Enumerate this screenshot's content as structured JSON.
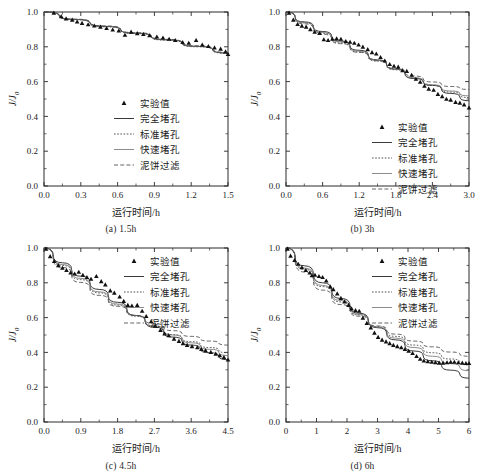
{
  "figure": {
    "axis_labels": {
      "x": "运行时间/h",
      "y": "J/J",
      "y_sub": "0"
    },
    "legend_entries": [
      {
        "key": "experimental",
        "label": "实验值",
        "style": "marker",
        "color": "#111111"
      },
      {
        "key": "complete_blocking",
        "label": "完全堵孔",
        "style": "solid",
        "color": "#3a3a3a"
      },
      {
        "key": "standard_blocking",
        "label": "标准堵孔",
        "style": "dotted",
        "color": "#3a3a3a"
      },
      {
        "key": "rapid_blocking",
        "label": "快速堵孔",
        "style": "thin-solid",
        "color": "#6f6f6f"
      },
      {
        "key": "cake_filtration",
        "label": "泥饼过滤",
        "style": "dashed",
        "color": "#4a4a4a"
      }
    ]
  },
  "chart_data": [
    {
      "type": "scatter",
      "panel": "a",
      "caption": "(a) 1.5h",
      "title": "",
      "xlabel": "运行时间/h",
      "ylabel": "J/J0",
      "xlim": [
        0.0,
        1.5
      ],
      "ylim": [
        0.0,
        1.0
      ],
      "xticks": [
        "0.0",
        "0.3",
        "0.6",
        "0.9",
        "1.2",
        "1.5"
      ],
      "xtick_values": [
        0.0,
        0.3,
        0.6,
        0.9,
        1.2,
        1.5
      ],
      "yticks": [
        "0.0",
        "0.2",
        "0.4",
        "0.6",
        "0.8",
        "1.0"
      ],
      "ytick_values": [
        0.0,
        0.2,
        0.4,
        0.6,
        0.8,
        1.0
      ],
      "grid": false,
      "legend_position": "center",
      "experimental": {
        "name": "实验值",
        "x": [
          0.08,
          0.14,
          0.18,
          0.23,
          0.27,
          0.31,
          0.36,
          0.41,
          0.46,
          0.51,
          0.56,
          0.61,
          0.66,
          0.71,
          0.76,
          0.81,
          0.86,
          0.92,
          0.97,
          1.02,
          1.07,
          1.13,
          1.18,
          1.24,
          1.29,
          1.34,
          1.39,
          1.44,
          1.48,
          1.5
        ],
        "y": [
          0.995,
          0.975,
          0.962,
          0.955,
          0.944,
          0.936,
          0.928,
          0.921,
          0.915,
          0.907,
          0.898,
          0.893,
          0.868,
          0.886,
          0.877,
          0.872,
          0.865,
          0.858,
          0.852,
          0.845,
          0.838,
          0.826,
          0.822,
          0.838,
          0.812,
          0.803,
          0.795,
          0.788,
          0.772,
          0.757
        ]
      },
      "series": [
        {
          "name": "完全堵孔",
          "key": "complete_blocking",
          "x": [
            0.0,
            0.25,
            0.5,
            0.75,
            1.0,
            1.25,
            1.5
          ],
          "y": [
            1.0,
            0.957,
            0.917,
            0.878,
            0.84,
            0.802,
            0.764
          ]
        },
        {
          "name": "标准堵孔",
          "key": "standard_blocking",
          "x": [
            0.0,
            0.25,
            0.5,
            0.75,
            1.0,
            1.25,
            1.5
          ],
          "y": [
            1.0,
            0.956,
            0.915,
            0.876,
            0.838,
            0.8,
            0.762
          ]
        },
        {
          "name": "快速堵孔",
          "key": "rapid_blocking",
          "x": [
            0.0,
            0.25,
            0.5,
            0.75,
            1.0,
            1.25,
            1.5
          ],
          "y": [
            1.0,
            0.958,
            0.918,
            0.879,
            0.841,
            0.803,
            0.765
          ]
        },
        {
          "name": "泥饼过滤",
          "key": "cake_filtration",
          "x": [
            0.0,
            0.25,
            0.5,
            0.75,
            1.0,
            1.25,
            1.5
          ],
          "y": [
            1.0,
            0.959,
            0.92,
            0.881,
            0.843,
            0.806,
            0.768
          ]
        }
      ]
    },
    {
      "type": "scatter",
      "panel": "b",
      "caption": "(b) 3h",
      "title": "",
      "xlabel": "运行时间/h",
      "ylabel": "J/J0",
      "xlim": [
        0.0,
        3.0
      ],
      "ylim": [
        0.0,
        1.0
      ],
      "xticks": [
        "0.0",
        "0.6",
        "1.2",
        "1.8",
        "2.4",
        "3.0"
      ],
      "xtick_values": [
        0.0,
        0.6,
        1.2,
        1.8,
        2.4,
        3.0
      ],
      "yticks": [
        "0.0",
        "0.2",
        "0.4",
        "0.6",
        "0.8",
        "1.0"
      ],
      "ytick_values": [
        0.0,
        0.2,
        0.4,
        0.6,
        0.8,
        1.0
      ],
      "grid": false,
      "legend_position": "center-right",
      "experimental": {
        "name": "实验值",
        "x": [
          0.05,
          0.12,
          0.19,
          0.26,
          0.33,
          0.4,
          0.47,
          0.55,
          0.62,
          0.69,
          0.76,
          0.83,
          0.9,
          0.98,
          1.05,
          1.12,
          1.19,
          1.26,
          1.34,
          1.41,
          1.48,
          1.55,
          1.62,
          1.7,
          1.77,
          1.84,
          1.91,
          1.98,
          2.06,
          2.13,
          2.2,
          2.27,
          2.34,
          2.42,
          2.49,
          2.56,
          2.63,
          2.7,
          2.78,
          2.85,
          2.92,
          3.0
        ],
        "y": [
          0.995,
          0.955,
          0.93,
          0.92,
          0.915,
          0.9,
          0.885,
          0.878,
          0.842,
          0.838,
          0.845,
          0.848,
          0.845,
          0.832,
          0.828,
          0.822,
          0.812,
          0.8,
          0.785,
          0.768,
          0.76,
          0.74,
          0.72,
          0.7,
          0.69,
          0.685,
          0.665,
          0.66,
          0.638,
          0.615,
          0.598,
          0.575,
          0.558,
          0.552,
          0.528,
          0.515,
          0.5,
          0.495,
          0.482,
          0.478,
          0.468,
          0.45
        ]
      },
      "series": [
        {
          "name": "完全堵孔",
          "key": "complete_blocking",
          "x": [
            0.0,
            0.3,
            0.6,
            0.9,
            1.2,
            1.5,
            1.8,
            2.1,
            2.4,
            2.7,
            3.0
          ],
          "y": [
            1.0,
            0.943,
            0.888,
            0.833,
            0.78,
            0.725,
            0.672,
            0.618,
            0.578,
            0.532,
            0.49
          ]
        },
        {
          "name": "标准堵孔",
          "key": "standard_blocking",
          "x": [
            0.0,
            0.3,
            0.6,
            0.9,
            1.2,
            1.5,
            1.8,
            2.1,
            2.4,
            2.7,
            3.0
          ],
          "y": [
            1.0,
            0.938,
            0.878,
            0.822,
            0.77,
            0.718,
            0.668,
            0.62,
            0.578,
            0.54,
            0.508
          ]
        },
        {
          "name": "快速堵孔",
          "key": "rapid_blocking",
          "x": [
            0.0,
            0.3,
            0.6,
            0.9,
            1.2,
            1.5,
            1.8,
            2.1,
            2.4,
            2.7,
            3.0
          ],
          "y": [
            1.0,
            0.94,
            0.882,
            0.828,
            0.775,
            0.722,
            0.67,
            0.622,
            0.582,
            0.546,
            0.518
          ]
        },
        {
          "name": "泥饼过滤",
          "key": "cake_filtration",
          "x": [
            0.0,
            0.3,
            0.6,
            0.9,
            1.2,
            1.5,
            1.8,
            2.1,
            2.4,
            2.7,
            3.0
          ],
          "y": [
            1.0,
            0.932,
            0.872,
            0.818,
            0.768,
            0.72,
            0.675,
            0.632,
            0.598,
            0.572,
            0.555
          ]
        }
      ]
    },
    {
      "type": "scatter",
      "panel": "c",
      "caption": "(c) 4.5h",
      "title": "",
      "xlabel": "运行时间/h",
      "ylabel": "J/J0",
      "xlim": [
        0.0,
        4.5
      ],
      "ylim": [
        0.0,
        1.0
      ],
      "xticks": [
        "0.0",
        "0.9",
        "1.8",
        "2.7",
        "3.6",
        "4.5"
      ],
      "xtick_values": [
        0.0,
        0.9,
        1.8,
        2.7,
        3.6,
        4.5
      ],
      "yticks": [
        "0.0",
        "0.2",
        "0.4",
        "0.6",
        "0.8",
        "1.0"
      ],
      "ytick_values": [
        0.0,
        0.2,
        0.4,
        0.6,
        0.8,
        1.0
      ],
      "grid": false,
      "legend_position": "top-right",
      "experimental": {
        "name": "实验值",
        "x": [
          0.05,
          0.15,
          0.25,
          0.35,
          0.45,
          0.55,
          0.65,
          0.75,
          0.85,
          0.95,
          1.05,
          1.15,
          1.28,
          1.4,
          1.5,
          1.62,
          1.72,
          1.85,
          1.95,
          2.05,
          2.15,
          2.28,
          2.4,
          2.5,
          2.62,
          2.72,
          2.85,
          2.95,
          3.05,
          3.18,
          3.3,
          3.4,
          3.5,
          3.62,
          3.75,
          3.85,
          3.95,
          4.08,
          4.2,
          4.3,
          4.4,
          4.5
        ],
        "y": [
          0.995,
          0.952,
          0.925,
          0.9,
          0.885,
          0.872,
          0.858,
          0.852,
          0.862,
          0.845,
          0.832,
          0.822,
          0.838,
          0.808,
          0.79,
          0.755,
          0.742,
          0.72,
          0.695,
          0.672,
          0.668,
          0.672,
          0.638,
          0.608,
          0.578,
          0.552,
          0.528,
          0.508,
          0.498,
          0.478,
          0.465,
          0.452,
          0.442,
          0.435,
          0.428,
          0.418,
          0.412,
          0.402,
          0.392,
          0.382,
          0.372,
          0.358
        ]
      },
      "series": [
        {
          "name": "完全堵孔",
          "key": "complete_blocking",
          "x": [
            0.0,
            0.45,
            0.9,
            1.35,
            1.8,
            2.25,
            2.7,
            3.15,
            3.6,
            4.05,
            4.5
          ],
          "y": [
            1.0,
            0.915,
            0.838,
            0.762,
            0.688,
            0.612,
            0.545,
            0.488,
            0.442,
            0.398,
            0.358
          ]
        },
        {
          "name": "标准堵孔",
          "key": "standard_blocking",
          "x": [
            0.0,
            0.45,
            0.9,
            1.35,
            1.8,
            2.25,
            2.7,
            3.15,
            3.6,
            4.05,
            4.5
          ],
          "y": [
            1.0,
            0.9,
            0.818,
            0.742,
            0.672,
            0.608,
            0.552,
            0.502,
            0.462,
            0.428,
            0.398
          ]
        },
        {
          "name": "快速堵孔",
          "key": "rapid_blocking",
          "x": [
            0.0,
            0.45,
            0.9,
            1.35,
            1.8,
            2.25,
            2.7,
            3.15,
            3.6,
            4.05,
            4.5
          ],
          "y": [
            1.0,
            0.905,
            0.825,
            0.748,
            0.678,
            0.612,
            0.552,
            0.5,
            0.455,
            0.418,
            0.382
          ]
        },
        {
          "name": "泥饼过滤",
          "key": "cake_filtration",
          "x": [
            0.0,
            0.45,
            0.9,
            1.35,
            1.8,
            2.25,
            2.7,
            3.15,
            3.6,
            4.05,
            4.5
          ],
          "y": [
            1.0,
            0.888,
            0.802,
            0.728,
            0.665,
            0.612,
            0.565,
            0.525,
            0.492,
            0.465,
            0.442
          ]
        }
      ]
    },
    {
      "type": "scatter",
      "panel": "d",
      "caption": "(d) 6h",
      "title": "",
      "xlabel": "运行时间/h",
      "ylabel": "J/J0",
      "xlim": [
        0,
        6
      ],
      "ylim": [
        0.0,
        1.0
      ],
      "xticks": [
        "0",
        "1",
        "2",
        "3",
        "4",
        "5",
        "6"
      ],
      "xtick_values": [
        0,
        1,
        2,
        3,
        4,
        5,
        6
      ],
      "yticks": [
        "0.0",
        "0.2",
        "0.4",
        "0.6",
        "0.8",
        "1.0"
      ],
      "ytick_values": [
        0.0,
        0.2,
        0.4,
        0.6,
        0.8,
        1.0
      ],
      "grid": false,
      "legend_position": "top-right",
      "experimental": {
        "name": "实验值",
        "x": [
          0.05,
          0.15,
          0.28,
          0.4,
          0.52,
          0.65,
          0.78,
          0.85,
          0.95,
          1.08,
          1.2,
          1.32,
          1.45,
          1.55,
          1.68,
          1.8,
          1.92,
          2.05,
          2.15,
          2.28,
          2.4,
          2.52,
          2.65,
          2.78,
          2.9,
          3.02,
          3.15,
          3.28,
          3.4,
          3.52,
          3.65,
          3.78,
          3.9,
          4.02,
          4.15,
          4.28,
          4.4,
          4.52,
          4.65,
          4.78,
          4.9,
          5.02,
          5.15,
          5.28,
          5.4,
          5.52,
          5.65,
          5.78,
          5.9,
          6.0
        ],
        "y": [
          0.995,
          0.955,
          0.93,
          0.908,
          0.888,
          0.872,
          0.858,
          0.842,
          0.845,
          0.838,
          0.832,
          0.812,
          0.778,
          0.762,
          0.738,
          0.712,
          0.692,
          0.672,
          0.652,
          0.642,
          0.638,
          0.598,
          0.568,
          0.542,
          0.512,
          0.488,
          0.472,
          0.462,
          0.452,
          0.442,
          0.435,
          0.428,
          0.418,
          0.408,
          0.395,
          0.378,
          0.362,
          0.352,
          0.348,
          0.345,
          0.342,
          0.34,
          0.34,
          0.342,
          0.345,
          0.345,
          0.342,
          0.34,
          0.338,
          0.338
        ]
      },
      "series": [
        {
          "name": "完全堵孔",
          "key": "complete_blocking",
          "x": [
            0.0,
            0.6,
            1.2,
            1.8,
            2.4,
            3.0,
            3.6,
            4.2,
            4.8,
            5.4,
            6.0
          ],
          "y": [
            1.0,
            0.898,
            0.8,
            0.71,
            0.625,
            0.542,
            0.472,
            0.408,
            0.352,
            0.298,
            0.252
          ]
        },
        {
          "name": "标准堵孔",
          "key": "standard_blocking",
          "x": [
            0.0,
            0.6,
            1.2,
            1.8,
            2.4,
            3.0,
            3.6,
            4.2,
            4.8,
            5.4,
            6.0
          ],
          "y": [
            1.0,
            0.878,
            0.778,
            0.69,
            0.615,
            0.548,
            0.492,
            0.442,
            0.398,
            0.362,
            0.328
          ]
        },
        {
          "name": "快速堵孔",
          "key": "rapid_blocking",
          "x": [
            0.0,
            0.6,
            1.2,
            1.8,
            2.4,
            3.0,
            3.6,
            4.2,
            4.8,
            5.4,
            6.0
          ],
          "y": [
            1.0,
            0.885,
            0.785,
            0.698,
            0.618,
            0.545,
            0.482,
            0.428,
            0.378,
            0.335,
            0.295
          ]
        },
        {
          "name": "泥饼过滤",
          "key": "cake_filtration",
          "x": [
            0.0,
            0.6,
            1.2,
            1.8,
            2.4,
            3.0,
            3.6,
            4.2,
            4.8,
            5.4,
            6.0
          ],
          "y": [
            1.0,
            0.862,
            0.758,
            0.675,
            0.608,
            0.552,
            0.505,
            0.465,
            0.432,
            0.402,
            0.378
          ]
        }
      ]
    }
  ]
}
